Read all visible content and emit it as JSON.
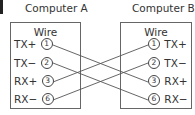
{
  "computer_a": {
    "title": "Computer A",
    "wire_label": "Wire",
    "pins": [
      {
        "signal": "TX+",
        "number": "1"
      },
      {
        "signal": "TX−",
        "number": "2"
      },
      {
        "signal": "RX+",
        "number": "3"
      },
      {
        "signal": "RX−",
        "number": "6"
      }
    ]
  },
  "computer_b": {
    "title": "Computer B",
    "wire_label": "Wire",
    "pins": [
      {
        "signal": "TX+",
        "number": "1"
      },
      {
        "signal": "TX−",
        "number": "2"
      },
      {
        "signal": "RX+",
        "number": "3"
      },
      {
        "signal": "RX−",
        "number": "6"
      }
    ]
  },
  "connections": [
    {
      "from": "A:1 TX+",
      "to": "B:3 RX+"
    },
    {
      "from": "A:2 TX−",
      "to": "B:6 RX−"
    },
    {
      "from": "A:3 RX+",
      "to": "B:1 TX+"
    },
    {
      "from": "A:6 RX−",
      "to": "B:2 TX−"
    }
  ],
  "colors": {
    "line": "#555555",
    "text": "#333333"
  }
}
